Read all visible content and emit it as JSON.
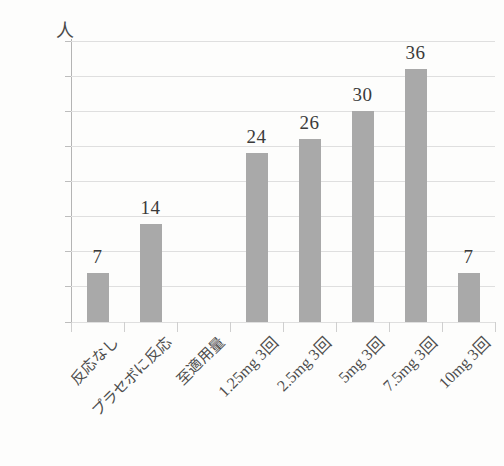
{
  "chart_data": {
    "type": "bar",
    "title": "",
    "xlabel": "",
    "ylabel": "人",
    "unit_label": "人",
    "ylim": [
      0,
      40
    ],
    "ytick_step": 5,
    "yticks": [
      "0",
      "5",
      "10",
      "15",
      "20",
      "25",
      "30",
      "35",
      "40"
    ],
    "grid": true,
    "legend": "none",
    "bar_color": "#a9a9a9",
    "gridline_color": "#dfdfdf",
    "axis_color": "#9e9e9e",
    "text_color": "#3b3b3b",
    "categories": [
      "反応なし",
      "プラセボに反応",
      "至適用量",
      "1.25mg 3回",
      "2.5mg 3回",
      "5mg 3回",
      "7.5mg 3回",
      "10mg 3回"
    ],
    "values": [
      7,
      14,
      0,
      24,
      26,
      30,
      36,
      7
    ],
    "value_labels": [
      "7",
      "14",
      "",
      "24",
      "26",
      "30",
      "36",
      "7"
    ]
  }
}
